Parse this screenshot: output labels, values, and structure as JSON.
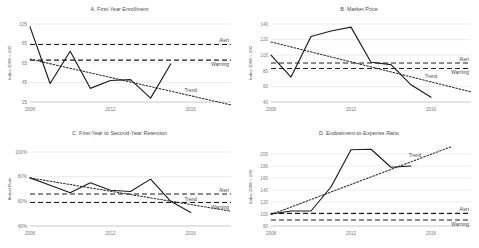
{
  "figure": {
    "panel_count": 4,
    "legend_labels": {
      "alert": "Alert",
      "warning": "Warning",
      "trend": "Trend"
    },
    "xticks": [
      "2008",
      "2012",
      "2016"
    ]
  },
  "chart_data": [
    {
      "id": "A",
      "type": "line",
      "title": "A. First-Year Enrollment",
      "xlabel": "",
      "ylabel": "Index 2008 = 100",
      "xlim": [
        2008,
        2018
      ],
      "ylim": [
        25,
        105
      ],
      "yticks": [
        105,
        85,
        65,
        45,
        25
      ],
      "ytick_labels": [
        "105",
        "85",
        "65",
        "45",
        "25"
      ],
      "xticks": [
        2008,
        2012,
        2016
      ],
      "xtick_labels": [
        "2008",
        "2012",
        "2016"
      ],
      "grid": true,
      "legend_position": "inline-right",
      "x": [
        2008,
        2009,
        2010,
        2011,
        2012,
        2013,
        2014,
        2015
      ],
      "series": [
        {
          "name": "Actual",
          "style": "solid",
          "values": [
            102,
            44,
            77,
            39,
            47,
            48,
            29,
            64
          ]
        }
      ],
      "thresholds": [
        {
          "name": "Alert",
          "value": 84,
          "style": "dashed"
        },
        {
          "name": "Warning",
          "value": 68,
          "style": "dashed"
        }
      ],
      "trend": {
        "name": "Trend",
        "style": "dotted",
        "x": [
          2008,
          2018
        ],
        "values": [
          69,
          22
        ]
      }
    },
    {
      "id": "B",
      "type": "line",
      "title": "B. Market Price",
      "xlabel": "",
      "ylabel": "Index 2008 = 100",
      "xlim": [
        2008,
        2018
      ],
      "ylim": [
        40,
        140
      ],
      "yticks": [
        140,
        120,
        100,
        80,
        60,
        40
      ],
      "ytick_labels": [
        "140",
        "120",
        "100",
        "80",
        "60",
        "40"
      ],
      "xticks": [
        2008,
        2012,
        2016
      ],
      "xtick_labels": [
        "2008",
        "2012",
        "2016"
      ],
      "grid": true,
      "legend_position": "inline-right",
      "x": [
        2008,
        2009,
        2010,
        2011,
        2012,
        2013,
        2014,
        2015,
        2016
      ],
      "series": [
        {
          "name": "Actual",
          "style": "solid",
          "values": [
            100,
            72,
            124,
            131,
            136,
            91,
            88,
            62,
            46
          ]
        }
      ],
      "thresholds": [
        {
          "name": "Alert",
          "value": 90,
          "style": "dashed"
        },
        {
          "name": "Warning",
          "value": 83,
          "style": "dashed"
        }
      ],
      "trend": {
        "name": "Trend",
        "style": "dotted",
        "x": [
          2008,
          2018
        ],
        "values": [
          117,
          53
        ]
      }
    },
    {
      "id": "C",
      "type": "line",
      "title": "C. First-Year to Second-Year Retention",
      "xlabel": "",
      "ylabel": "Actual Rate",
      "xlim": [
        2008,
        2018
      ],
      "ylim": [
        40,
        100
      ],
      "yticks": [
        100,
        80,
        60,
        40
      ],
      "ytick_labels": [
        "100%",
        "80%",
        "60%",
        "40%"
      ],
      "xticks": [
        2008,
        2012,
        2016
      ],
      "xtick_labels": [
        "2008",
        "2012",
        "2016"
      ],
      "grid": true,
      "legend_position": "inline-right",
      "x": [
        2008,
        2009,
        2010,
        2011,
        2012,
        2013,
        2014,
        2015,
        2016
      ],
      "series": [
        {
          "name": "Actual",
          "style": "solid",
          "values": [
            79,
            73,
            67,
            75,
            69,
            68,
            78,
            60,
            51
          ]
        }
      ],
      "thresholds": [
        {
          "name": "Alert",
          "value": 66,
          "style": "dashed"
        },
        {
          "name": "Warning",
          "value": 59,
          "style": "dashed"
        }
      ],
      "trend": {
        "name": "Trend",
        "style": "dotted",
        "x": [
          2008,
          2018
        ],
        "values": [
          79,
          52
        ]
      }
    },
    {
      "id": "D",
      "type": "line",
      "title": "D. Endowment-to-Expense Ratio",
      "xlabel": "",
      "ylabel": "Index 2008 = 100",
      "xlim": [
        2008,
        2018
      ],
      "ylim": [
        80,
        210
      ],
      "yticks": [
        200,
        180,
        160,
        140,
        120,
        100,
        80
      ],
      "ytick_labels": [
        "200",
        "180",
        "160",
        "140",
        "120",
        "100",
        "80"
      ],
      "xticks": [
        2008,
        2012,
        2016
      ],
      "xtick_labels": [
        "2008",
        "2012",
        "2016"
      ],
      "grid": true,
      "legend_position": "inline-right",
      "x": [
        2008,
        2009,
        2010,
        2011,
        2012,
        2013,
        2014,
        2015
      ],
      "series": [
        {
          "name": "Actual",
          "style": "solid",
          "values": [
            100,
            105,
            105,
            145,
            207,
            208,
            178,
            180
          ]
        }
      ],
      "thresholds": [
        {
          "name": "Alert",
          "value": 101,
          "style": "dashed"
        },
        {
          "name": "Warning",
          "value": 90,
          "style": "dashed"
        }
      ],
      "trend": {
        "name": "Trend",
        "style": "dotted",
        "x": [
          2008,
          2017
        ],
        "values": [
          99,
          212
        ]
      }
    }
  ]
}
